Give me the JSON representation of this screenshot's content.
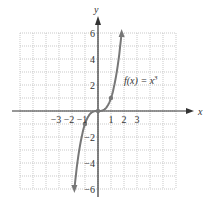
{
  "chart_data": {
    "type": "line",
    "title": "",
    "function_label": "f(x) = x³",
    "function_label_parts": {
      "prefix": "f(x) = x",
      "exponent": "3"
    },
    "xlabel": "x",
    "ylabel": "y",
    "xlim": [
      -6,
      6
    ],
    "ylim": [
      -6,
      6
    ],
    "grid": true,
    "x_ticks": [
      -3,
      -2,
      -1,
      1,
      2,
      3
    ],
    "x_tick_labels": [
      "−3",
      "−2",
      "−1",
      "1",
      "2",
      "3"
    ],
    "y_ticks": [
      6,
      4,
      2,
      -2,
      -4,
      -6
    ],
    "y_tick_labels": [
      "6",
      "4",
      "2",
      "−2",
      "−4",
      "−6"
    ],
    "series": [
      {
        "name": "f(x) = x^3",
        "x": [
          -1.817,
          -1.5,
          -1,
          -0.5,
          0,
          0.5,
          1,
          1.5,
          1.817
        ],
        "y": [
          -6,
          -3.375,
          -1,
          -0.125,
          0,
          0.125,
          1,
          3.375,
          6
        ]
      }
    ],
    "marked_points": [
      {
        "x": -1,
        "y": -1
      },
      {
        "x": 0,
        "y": 0
      },
      {
        "x": 1,
        "y": 1
      }
    ],
    "colors": {
      "curve": "#777777",
      "axis": "#333333",
      "grid": "#bbbbbb"
    }
  }
}
